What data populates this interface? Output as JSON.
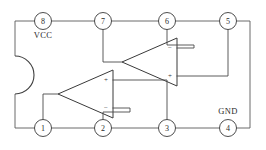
{
  "figure": {
    "kind": "ic-pinout-schematic",
    "background_color": "#ffffff",
    "line_color": "#4a4a4a",
    "symbol_color": "#3a3a3a",
    "text_color": "#2b2b2b"
  },
  "package": {
    "notch_name": "package-notch",
    "pin_count": 8
  },
  "pins": {
    "top": [
      {
        "number": "8",
        "cx": 43,
        "cy": 21,
        "label": "VCC",
        "label_x": 43,
        "label_y": 38
      },
      {
        "number": "7",
        "cx": 103,
        "cy": 21,
        "label": "",
        "label_x": 103,
        "label_y": 38
      },
      {
        "number": "6",
        "cx": 167,
        "cy": 21,
        "label": "",
        "label_x": 167,
        "label_y": 38
      },
      {
        "number": "5",
        "cx": 228,
        "cy": 21,
        "label": "",
        "label_x": 228,
        "label_y": 38
      }
    ],
    "bottom": [
      {
        "number": "1",
        "cx": 43,
        "cy": 128,
        "label": "",
        "label_x": 43,
        "label_y": 114
      },
      {
        "number": "2",
        "cx": 103,
        "cy": 128,
        "label": "",
        "label_x": 103,
        "label_y": 114
      },
      {
        "number": "3",
        "cx": 167,
        "cy": 128,
        "label": "",
        "label_x": 167,
        "label_y": 114
      },
      {
        "number": "4",
        "cx": 228,
        "cy": 128,
        "label": "GND",
        "label_x": 228,
        "label_y": 114
      }
    ]
  },
  "rails": {
    "vcc_label": "VCC",
    "gnd_label": "GND"
  },
  "amplifiers": [
    {
      "name": "upper-opamp",
      "orientation": "points-left",
      "input_top": "−",
      "input_bottom": "+",
      "output_pin": "7",
      "inverting_input_pin": "6",
      "noninverting_input_pin": "5"
    },
    {
      "name": "lower-opamp",
      "orientation": "points-left",
      "input_top": "+",
      "input_bottom": "−",
      "output_pin": "1",
      "inverting_input_pin": "2",
      "noninverting_input_pin": "3"
    }
  ],
  "polarity_marks": {
    "upper_minus": "−",
    "upper_plus": "+",
    "lower_plus": "+",
    "lower_minus": "−"
  }
}
